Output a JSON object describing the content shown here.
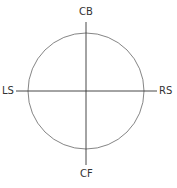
{
  "diagram": {
    "labels": {
      "top": "CB",
      "bottom": "CF",
      "left": "LS",
      "right": "RS"
    },
    "stroke_color": "#555555"
  }
}
